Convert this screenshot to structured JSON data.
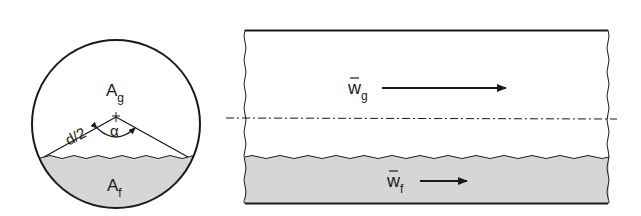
{
  "diagram": {
    "cross_section": {
      "gas_area_label": "A",
      "gas_area_sub": "g",
      "liquid_area_label": "A",
      "liquid_area_sub": "f",
      "radius_label": "d/2",
      "angle_label": "α"
    },
    "pipe_section": {
      "gas_velocity_label": "w",
      "gas_velocity_sub": "g",
      "liquid_velocity_label": "w",
      "liquid_velocity_sub": "f"
    },
    "colors": {
      "line": "#1a1a1a",
      "liquid_fill": "#d6d6d6",
      "background": "#ffffff"
    }
  }
}
